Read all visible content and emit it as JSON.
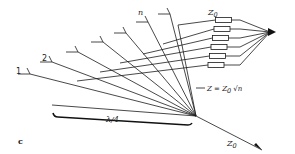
{
  "figure": {
    "panel_label": "c",
    "element_labels": [
      "1",
      "2",
      "n"
    ],
    "element_count_drawn": 7,
    "resistor_count": 6,
    "resistor_label": "Z",
    "resistor_label_sub": "0",
    "impedance_label": "Z = Z",
    "impedance_label_sub": "0",
    "impedance_label_root": "√n",
    "wavelength_label": "λ/4",
    "feed_label": "Z",
    "feed_label_sub": "0"
  }
}
